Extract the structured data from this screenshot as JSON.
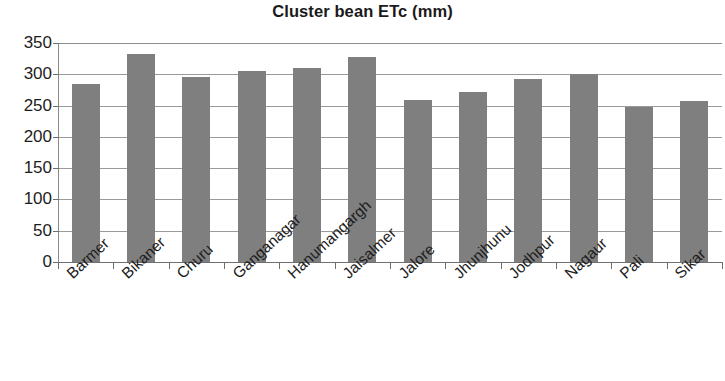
{
  "chart_data": {
    "type": "bar",
    "title": "Cluster bean ETc (mm)",
    "xlabel": "",
    "ylabel": "",
    "ylim": [
      0,
      350
    ],
    "ytick_step": 50,
    "yticks": [
      0,
      50,
      100,
      150,
      200,
      250,
      300,
      350
    ],
    "ytick_labels": [
      "0",
      "50",
      "100",
      "150",
      "200",
      "250",
      "300",
      "350"
    ],
    "grid": true,
    "grid_axis": "y",
    "legend": false,
    "legend_position": "none",
    "bar_color": "#7f7f7f",
    "categories": [
      "Barmer",
      "Bikaner",
      "Churu",
      "Ganganagar",
      "Hanumangargh",
      "Jaisalmer",
      "Jalore",
      "Jhunjhunu",
      "Jodhpur",
      "Nagaur",
      "Pali",
      "Sikar"
    ],
    "values": [
      284,
      332,
      295,
      306,
      310,
      327,
      259,
      272,
      292,
      300,
      247,
      257
    ],
    "series": [
      {
        "name": "Cluster bean ETc (mm)",
        "values": [
          284,
          332,
          295,
          306,
          310,
          327,
          259,
          272,
          292,
          300,
          247,
          257
        ]
      }
    ]
  }
}
